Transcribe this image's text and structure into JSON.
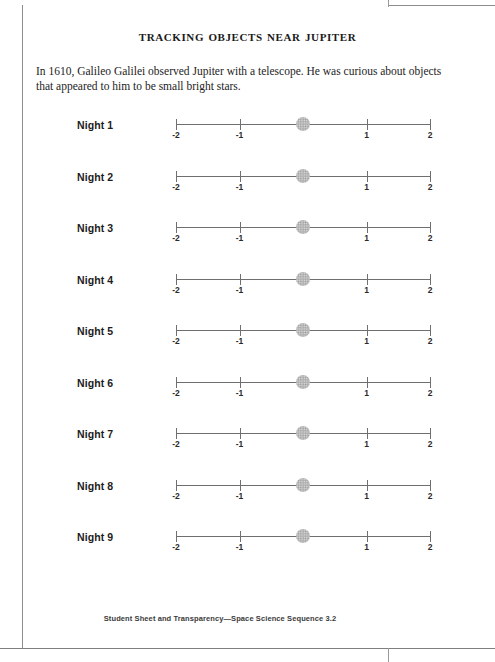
{
  "document": {
    "title": "Tracking Objects Near Jupiter",
    "intro": "In 1610, Galileo Galilei observed Jupiter with a telescope. He was curious about objects that appeared to him to be small bright stars.",
    "footer": "Student Sheet and Transparency—Space Science Sequence 3.2"
  },
  "colors": {
    "axis": "#6f6f6f",
    "jupiter": "#b9b9b9",
    "text": "#1a1a1a",
    "page_border": "#8d8d8d"
  },
  "chart_data": {
    "type": "scatter",
    "title": "Tracking Objects Near Jupiter",
    "xlabel": "",
    "ylabel": "",
    "xlim": [
      -2,
      2
    ],
    "grid": false,
    "legend": null,
    "tick_labels": [
      "-2",
      "-1",
      "",
      "1",
      "2"
    ],
    "tick_values": [
      -2,
      -1,
      0,
      1,
      2
    ],
    "series": [
      {
        "name": "Night 1",
        "jupiter_x": 0,
        "moons": []
      },
      {
        "name": "Night 2",
        "jupiter_x": 0,
        "moons": []
      },
      {
        "name": "Night 3",
        "jupiter_x": 0,
        "moons": []
      },
      {
        "name": "Night 4",
        "jupiter_x": 0,
        "moons": []
      },
      {
        "name": "Night 5",
        "jupiter_x": 0,
        "moons": []
      },
      {
        "name": "Night 6",
        "jupiter_x": 0,
        "moons": []
      },
      {
        "name": "Night 7",
        "jupiter_x": 0,
        "moons": []
      },
      {
        "name": "Night 8",
        "jupiter_x": 0,
        "moons": []
      },
      {
        "name": "Night 9",
        "jupiter_x": 0,
        "moons": []
      }
    ]
  },
  "rows": [
    {
      "label": "Night 1"
    },
    {
      "label": "Night 2"
    },
    {
      "label": "Night 3"
    },
    {
      "label": "Night 4"
    },
    {
      "label": "Night 5"
    },
    {
      "label": "Night 6"
    },
    {
      "label": "Night 7"
    },
    {
      "label": "Night 8"
    },
    {
      "label": "Night 9"
    }
  ]
}
